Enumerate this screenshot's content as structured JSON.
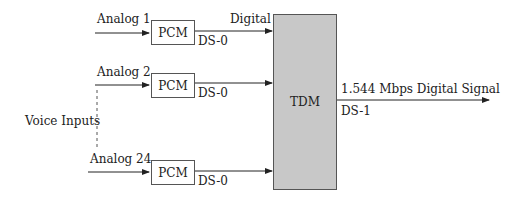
{
  "inputs": [
    {
      "label": "Analog 1",
      "block": "PCM",
      "out_label": "DS-0",
      "signal_label": "Digital"
    },
    {
      "label": "Analog 2",
      "block": "PCM",
      "out_label": "DS-0"
    },
    {
      "label": "Analog 24",
      "block": "PCM",
      "out_label": "DS-0"
    }
  ],
  "group_label": "Voice Inputs",
  "multiplexer": {
    "label": "TDM",
    "fill": "#c8c8c8"
  },
  "output": {
    "label": "1.544 Mbps Digital Signal",
    "sub_label": "DS-1"
  }
}
